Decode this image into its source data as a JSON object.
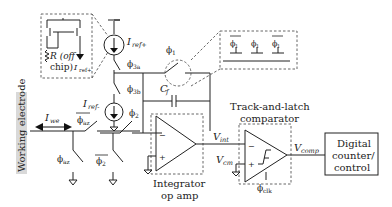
{
  "labels": {
    "working_electrode": "Working electrode",
    "i_we": "I",
    "i_we_sub": "we",
    "i_ref_plus": "I",
    "i_ref_plus_sub": "ref+",
    "i_ref_minus": "I",
    "i_ref_minus_sub": "ref-",
    "r_offchip_1": "R (off",
    "r_offchip_2": "chip)",
    "i_ref_inset": "I",
    "i_ref_inset_sub": "ref+",
    "phi_3a": "ϕ",
    "phi_3a_sub": "3a",
    "phi_3b": "ϕ",
    "phi_3b_sub": "3b",
    "phi_1": "ϕ",
    "phi_1_sub": "1",
    "phi_2_top": "ϕ",
    "phi_2_top_sub": "2",
    "phi_2_bar": "ϕ",
    "phi_2_bar_sub": "2",
    "phi_az_bar": "ϕ",
    "phi_az_bar_sub": "az",
    "phi_az": "ϕ",
    "phi_az_sub": "az",
    "cf": "C",
    "cf_sub": "f",
    "v_int": "V",
    "v_int_sub": "int",
    "v_cm": "V",
    "v_cm_sub": "cm",
    "v_comp": "V",
    "v_comp_sub": "comp",
    "phi_clk": "ϕ",
    "phi_clk_sub": "clk",
    "integrator_1": "Integrator",
    "integrator_2": "op amp",
    "comparator_1": "Track-and-latch",
    "comparator_2": "comparator",
    "digital_1": "Digital",
    "digital_2": "counter/",
    "digital_3": "control",
    "minus": "−",
    "plus": "+",
    "inset_phi": [
      "ϕ",
      "ϕ",
      "ϕ"
    ],
    "inset_phi_sub": [
      "1",
      "1",
      "1"
    ]
  }
}
